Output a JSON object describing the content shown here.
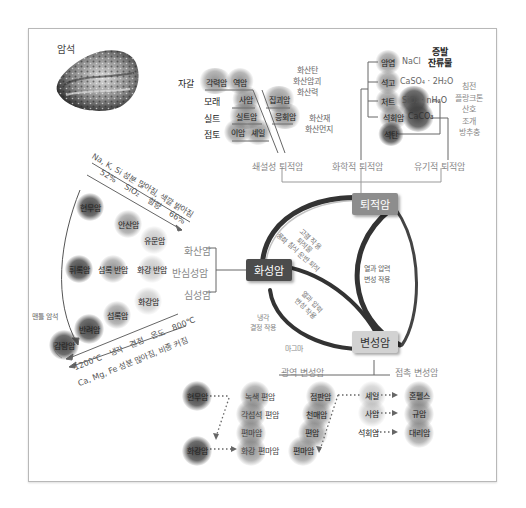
{
  "title": "암석",
  "rock_cycle": {
    "igneous": "화성암",
    "sedimentary": "퇴적암",
    "metamorphic": "변성암",
    "arc_labels": {
      "weathering": [
        "고결 작용",
        "퇴적물",
        "풍화 침식 운반 퇴적"
      ],
      "heat_pressure_right": [
        "열과 압력",
        "변성 작용"
      ],
      "heat_pressure_inner": [
        "열과 압력",
        "변성 작용"
      ],
      "cooling": [
        "냉각",
        "결정 작용"
      ],
      "magma": "마그마"
    }
  },
  "sedimentary": {
    "clastic": {
      "title": "쇄설성 퇴적암",
      "rows": [
        {
          "sediment": "자갈",
          "rocks": [
            "각력암",
            "역암"
          ]
        },
        {
          "sediment": "모래",
          "rocks": [
            "사암"
          ]
        },
        {
          "sediment": "실트",
          "rocks": [
            "실트암"
          ]
        },
        {
          "sediment": "점토",
          "rocks": [
            "이암",
            "셰일"
          ]
        }
      ],
      "volcanic_rocks": [
        "집괴암",
        "응회암"
      ],
      "volcanic_sources_1": [
        "화산탄",
        "화산암괴",
        "화산력"
      ],
      "volcanic_sources_2": [
        "화산재",
        "화산먼지"
      ]
    },
    "chemical": {
      "title": "화학적 퇴적암",
      "rows": [
        {
          "rock": "암염",
          "formula": "NaCl"
        },
        {
          "rock": "석고",
          "formula": "CaSO₄ · 2H₂O"
        },
        {
          "rock": "처트",
          "formula": "SiO₂ · nH₂O"
        },
        {
          "rock": "석회암",
          "formula": "CaCO₃"
        },
        {
          "rock": "석탄",
          "formula": ""
        }
      ],
      "evaporite_label": [
        "증발",
        "잔류물"
      ]
    },
    "organic": {
      "title": "유기적 퇴적암",
      "sources": [
        "침전",
        "플랑크톤",
        "산호",
        "조개",
        "방추충"
      ]
    }
  },
  "igneous": {
    "types": [
      "화산암",
      "반심성암",
      "심성암"
    ],
    "top_arrow": "Na, K, Si 성분 많아짐, 색깔 밝아짐",
    "sio2": {
      "low": "52%",
      "label": "SiO₂ 함량",
      "high": "66%"
    },
    "volcanic": [
      "현무암",
      "안산암",
      "유문암"
    ],
    "hypabyssal": [
      "휘록암",
      "섬록 반암",
      "화강 반암"
    ],
    "plutonic": [
      "감람암",
      "반려암",
      "섬록암",
      "화강암"
    ],
    "mantle_label": "맨틀 암석",
    "temp": {
      "high": "1200℃",
      "label": "냉각 결정 온도",
      "low": "800℃"
    },
    "bottom_arrow": "Ca, Mg, Fe 성분 많아짐, 비중 커짐"
  },
  "metamorphic": {
    "regional": {
      "title": "광역 변성암",
      "col1": [
        "현무암",
        "녹색 편암",
        "각섬석 편암",
        "편마암",
        "화강암",
        "화강 편마암"
      ],
      "col2": [
        "점판암",
        "천매암",
        "편암",
        "편마암"
      ]
    },
    "contact": {
      "title": "접촉 변성암",
      "pairs": [
        {
          "from": "셰일",
          "to": "혼펠스"
        },
        {
          "from": "사암",
          "to": "규암"
        },
        {
          "from": "석회암",
          "to": "대리암"
        }
      ]
    }
  }
}
